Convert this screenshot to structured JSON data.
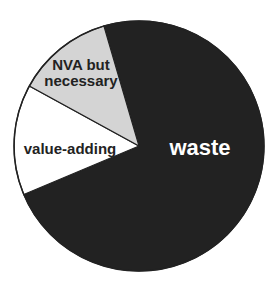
{
  "chart_data": {
    "type": "pie",
    "title": "",
    "categories": [
      "waste",
      "value-adding",
      "NVA but necessary"
    ],
    "values": [
      73.2,
      14.3,
      12.5
    ],
    "units": "percent (estimated from slice angles)",
    "slices": [
      {
        "label": "waste",
        "value": 73.2,
        "start_deg": 202.8,
        "end_deg": 466.3,
        "fill": "#222222",
        "label_color": "#ffffff",
        "label_lines": [
          "waste"
        ],
        "label_pos": [
          200,
          155
        ],
        "font_size": 22
      },
      {
        "label": "value-adding",
        "value": 14.3,
        "start_deg": 151.3,
        "end_deg": 202.8,
        "fill": "#ffffff",
        "label_color": "#222222",
        "label_lines": [
          "value-adding"
        ],
        "label_pos": [
          70,
          154
        ],
        "font_size": 15
      },
      {
        "label": "NVA but necessary",
        "value": 12.5,
        "start_deg": 106.3,
        "end_deg": 151.3,
        "fill": "#d4d4d4",
        "label_color": "#222222",
        "label_lines": [
          "NVA but",
          "necessary"
        ],
        "label_pos": [
          81,
          78
        ],
        "font_size": 15
      }
    ],
    "legend": "none (labels placed inside slices)",
    "center": [
      139,
      146
    ],
    "radius": 125,
    "outline_color": "#222222"
  }
}
